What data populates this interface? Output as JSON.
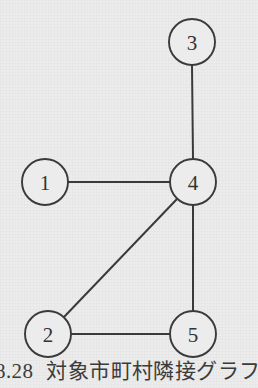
{
  "figure": {
    "background_color": "#ececec",
    "stroke_color": "#3a3a3a",
    "label_color": "#333333",
    "caption_number": "8.28",
    "caption_text": "対象市町村隣接グラフ",
    "caption_full": "8.28  対象市町村隣接グラフ"
  },
  "chart_data": {
    "type": "diagram",
    "diagram_type": "undirected-graph",
    "node_radius": 23,
    "nodes": [
      {
        "id": "3",
        "label": "3",
        "x": 192,
        "y": 42
      },
      {
        "id": "1",
        "label": "1",
        "x": 45,
        "y": 182
      },
      {
        "id": "4",
        "label": "4",
        "x": 193,
        "y": 182
      },
      {
        "id": "2",
        "label": "2",
        "x": 48,
        "y": 334
      },
      {
        "id": "5",
        "label": "5",
        "x": 193,
        "y": 334
      }
    ],
    "edges": [
      {
        "from": "3",
        "to": "4",
        "x1": 192,
        "y1": 65,
        "x2": 193,
        "y2": 159
      },
      {
        "from": "1",
        "to": "4",
        "x1": 68,
        "y1": 182,
        "x2": 170,
        "y2": 182
      },
      {
        "from": "2",
        "to": "4",
        "x1": 64,
        "y1": 317,
        "x2": 177,
        "y2": 199
      },
      {
        "from": "2",
        "to": "5",
        "x1": 71,
        "y1": 334,
        "x2": 170,
        "y2": 334
      },
      {
        "from": "4",
        "to": "5",
        "x1": 193,
        "y1": 205,
        "x2": 193,
        "y2": 311
      }
    ],
    "degrees": {
      "1": 1,
      "2": 2,
      "3": 1,
      "4": 4,
      "5": 2
    },
    "node_count": 5,
    "edge_count": 5
  }
}
